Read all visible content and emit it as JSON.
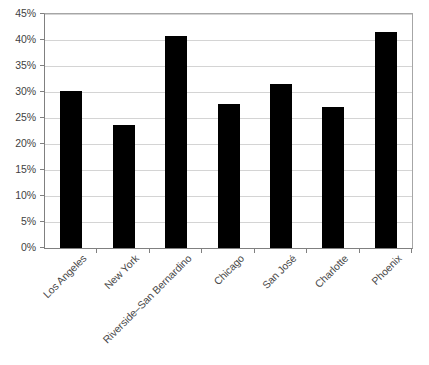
{
  "chart_data": {
    "type": "bar",
    "title": "",
    "subtitle": "",
    "xlabel": "",
    "ylabel": "",
    "categories": [
      "Los Angeles",
      "New York",
      "Riverside–San Bernardino",
      "Chicago",
      "San José",
      "Charlotte",
      "Phoenix"
    ],
    "values": [
      30.1,
      23.6,
      40.8,
      27.7,
      31.5,
      27.1,
      41.5
    ],
    "value_format": "percent",
    "ylim": [
      0,
      45
    ],
    "ytick_values": [
      0,
      5,
      10,
      15,
      20,
      25,
      30,
      35,
      40,
      45
    ],
    "ytick_labels": [
      "0%",
      "5%",
      "10%",
      "15%",
      "20%",
      "25%",
      "30%",
      "35%",
      "40%",
      "45%"
    ],
    "grid": true,
    "grid_axis": "y",
    "legend": false,
    "legend_position": "none",
    "bar_color": "#000000",
    "gridline_color": "#d4d4d4",
    "axis_color": "#808080",
    "plot_border_color": "#a6a6a6",
    "background_color": "#ffffff",
    "tick_label_color": "#3f3f3f",
    "category_label_color": "#4a4a4a",
    "category_label_rotation": -45
  }
}
